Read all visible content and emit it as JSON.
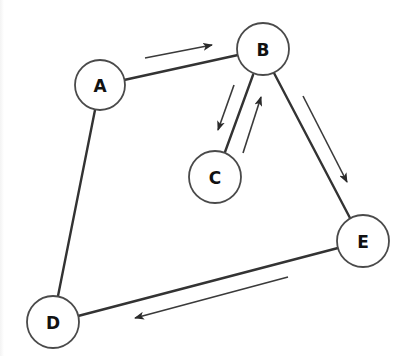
{
  "diagram": {
    "type": "directed-graph",
    "colors": {
      "background": "#ffffff",
      "edge": "#333333",
      "arrow": "#3a3a3a",
      "node_stroke": "#4a4a4a",
      "label": "#111111"
    },
    "nodes": [
      {
        "id": "A",
        "label": "A",
        "cx": 100,
        "cy": 85,
        "r": 25
      },
      {
        "id": "B",
        "label": "B",
        "cx": 263,
        "cy": 49,
        "r": 26
      },
      {
        "id": "C",
        "label": "C",
        "cx": 215,
        "cy": 177,
        "r": 26
      },
      {
        "id": "D",
        "label": "D",
        "cx": 53,
        "cy": 322,
        "r": 26
      },
      {
        "id": "E",
        "label": "E",
        "cx": 363,
        "cy": 241,
        "r": 26
      }
    ],
    "edges": [
      {
        "from": "A",
        "to": "B"
      },
      {
        "from": "B",
        "to": "C"
      },
      {
        "from": "B",
        "to": "E"
      },
      {
        "from": "E",
        "to": "D"
      },
      {
        "from": "A",
        "to": "D"
      }
    ],
    "flow_arrows": [
      {
        "name": "A-to-B",
        "direction": "A→B"
      },
      {
        "name": "B-to-C",
        "direction": "B→C"
      },
      {
        "name": "C-to-B",
        "direction": "C→B"
      },
      {
        "name": "B-to-E",
        "direction": "B→E"
      },
      {
        "name": "E-to-D",
        "direction": "E→D"
      }
    ]
  }
}
